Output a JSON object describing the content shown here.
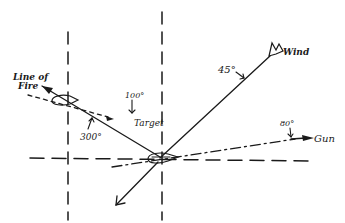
{
  "diagram": {
    "title": "",
    "labels": {
      "line_of_fire_line1": "Line of",
      "line_of_fire_line2": "Fire",
      "target": "Target",
      "wind": "Wind",
      "gun": "Gun"
    },
    "angles": {
      "target_bearing": "100°",
      "line_of_fire_bearing": "300°",
      "wind_bearing": "45°",
      "gun_bearing": "80°"
    },
    "colors": {
      "ink": "#1a1a1a",
      "background": "#ffffff"
    }
  }
}
